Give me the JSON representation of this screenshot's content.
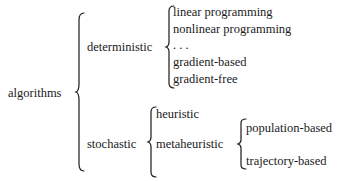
{
  "diagram": {
    "type": "taxonomy-tree",
    "root": {
      "label": "algorithms",
      "children": [
        {
          "label": "deterministic",
          "children": [
            {
              "label": "linear programming"
            },
            {
              "label": "nonlinear programming"
            },
            {
              "label": ". . ."
            },
            {
              "label": "gradient-based"
            },
            {
              "label": "gradient-free"
            }
          ]
        },
        {
          "label": "stochastic",
          "children": [
            {
              "label": "heuristic"
            },
            {
              "label": "metaheuristic",
              "children": [
                {
                  "label": "population-based"
                },
                {
                  "label": "trajectory-based"
                }
              ]
            }
          ]
        }
      ]
    }
  }
}
